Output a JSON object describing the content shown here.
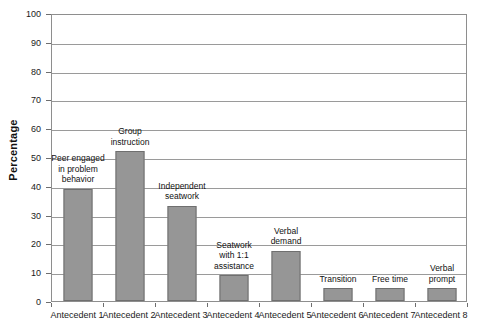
{
  "chart_data": {
    "type": "bar",
    "title": "",
    "subtitle": "",
    "xlabel": "",
    "ylabel": "Percentage",
    "ylim": [
      0,
      100
    ],
    "ytick_step": 10,
    "grid": true,
    "legend": "none",
    "bar_color": "#969696",
    "bar_edge_color": "#6f6f6f",
    "categories": [
      "Antecedent 1",
      "Antecedent 2",
      "Antecedent 3",
      "Antecedent 4",
      "Antecedent 5",
      "Antecedent 6",
      "Antecedent 7",
      "Antecedent 8"
    ],
    "values": [
      39,
      52,
      33,
      9,
      17.5,
      4.5,
      4.5,
      4.5
    ],
    "ytick_labels": [
      "0",
      "10",
      "20",
      "30",
      "40",
      "50",
      "60",
      "70",
      "80",
      "90",
      "100"
    ],
    "annotations": [
      "Peer engaged\nin problem\nbehavior",
      "Group\ninstruction",
      "Independent\nseatwork",
      "Seatwork\nwith 1:1\nassistance",
      "Verbal\ndemand",
      "Transition",
      "Free time",
      "Verbal\nprompt"
    ]
  }
}
